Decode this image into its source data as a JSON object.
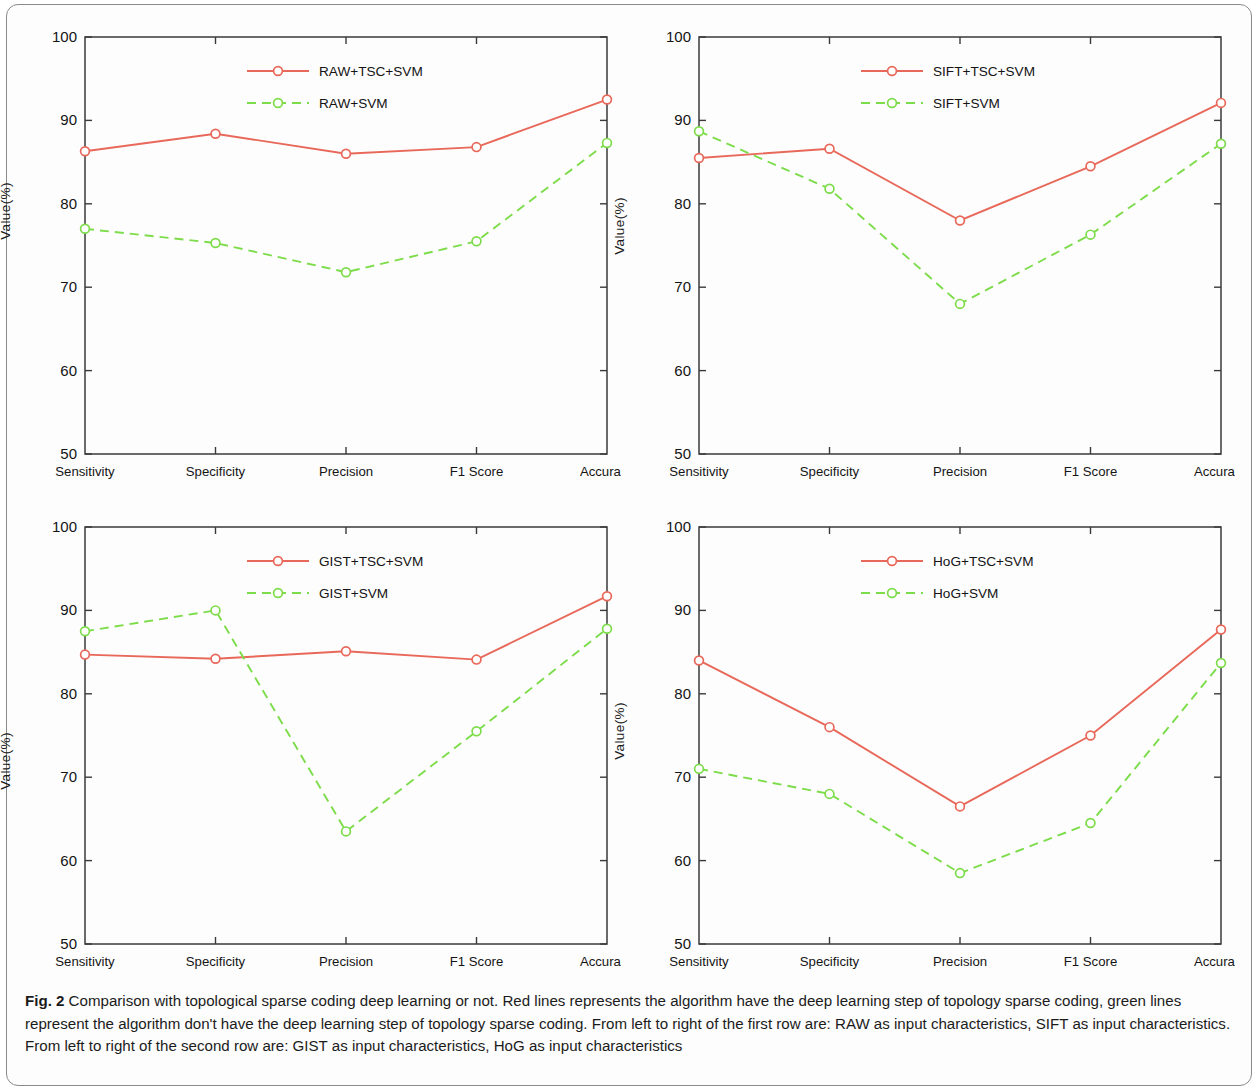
{
  "figure": {
    "label": "Fig. 2",
    "caption": "Comparison with topological sparse coding deep learning or not. Red lines represents the algorithm have the deep learning step of topology sparse coding, green lines represent the algorithm don't have the deep learning step of topology sparse coding. From left to right of the first row are: RAW as input characteristics, SIFT as input characteristics. From left to right of the second row are: GIST as input characteristics, HoG as input characteristics"
  },
  "colors": {
    "red": "#e8685a",
    "green": "#7ddc4a",
    "axis": "#3a3a3a",
    "text": "#141414"
  },
  "axes": {
    "ylabel": "Value(%)",
    "yticks": [
      "100",
      "90",
      "80",
      "70",
      "60",
      "50"
    ],
    "ymin": 50,
    "ymax": 100,
    "categories": [
      "Sensitivity",
      "Specificity",
      "Precision",
      "F1 Score",
      "Accuracy"
    ]
  },
  "chart_data": [
    {
      "type": "line",
      "title": "",
      "panel": "top-left",
      "xlabel": "",
      "ylabel": "Value(%)",
      "ylim": [
        50,
        100
      ],
      "grid": false,
      "legend_position": "top-center",
      "categories": [
        "Sensitivity",
        "Specificity",
        "Precision",
        "F1 Score",
        "Accuracy"
      ],
      "series": [
        {
          "name": "RAW+TSC+SVM",
          "color": "#e8685a",
          "style": "solid",
          "marker": "circle",
          "values": [
            86.3,
            88.4,
            86.0,
            86.8,
            92.5
          ]
        },
        {
          "name": "RAW+SVM",
          "color": "#7ddc4a",
          "style": "dashed",
          "marker": "circle",
          "values": [
            77.0,
            75.3,
            71.8,
            75.5,
            87.3
          ]
        }
      ]
    },
    {
      "type": "line",
      "title": "",
      "panel": "top-right",
      "xlabel": "",
      "ylabel": "Value(%)",
      "ylim": [
        50,
        100
      ],
      "grid": false,
      "legend_position": "top-center",
      "categories": [
        "Sensitivity",
        "Specificity",
        "Precision",
        "F1 Score",
        "Accuracy"
      ],
      "series": [
        {
          "name": "SIFT+TSC+SVM",
          "color": "#e8685a",
          "style": "solid",
          "marker": "circle",
          "values": [
            85.5,
            86.6,
            78.0,
            84.5,
            92.1
          ]
        },
        {
          "name": "SIFT+SVM",
          "color": "#7ddc4a",
          "style": "dashed",
          "marker": "circle",
          "values": [
            88.7,
            81.8,
            68.0,
            76.3,
            87.2
          ]
        }
      ]
    },
    {
      "type": "line",
      "title": "",
      "panel": "bottom-left",
      "xlabel": "",
      "ylabel": "Value(%)",
      "ylim": [
        50,
        100
      ],
      "grid": false,
      "legend_position": "top-center",
      "categories": [
        "Sensitivity",
        "Specificity",
        "Precision",
        "F1 Score",
        "Accuracy"
      ],
      "series": [
        {
          "name": "GIST+TSC+SVM",
          "color": "#e8685a",
          "style": "solid",
          "marker": "circle",
          "values": [
            84.7,
            84.2,
            85.1,
            84.1,
            91.7
          ]
        },
        {
          "name": "GIST+SVM",
          "color": "#7ddc4a",
          "style": "dashed",
          "marker": "circle",
          "values": [
            87.5,
            90.0,
            63.5,
            75.5,
            87.8
          ]
        }
      ]
    },
    {
      "type": "line",
      "title": "",
      "panel": "bottom-right",
      "xlabel": "",
      "ylabel": "Value(%)",
      "ylim": [
        50,
        100
      ],
      "grid": false,
      "legend_position": "top-center",
      "categories": [
        "Sensitivity",
        "Specificity",
        "Precision",
        "F1 Score",
        "Accuracy"
      ],
      "series": [
        {
          "name": "HoG+TSC+SVM",
          "color": "#e8685a",
          "style": "solid",
          "marker": "circle",
          "values": [
            84.0,
            76.0,
            66.5,
            75.0,
            87.7
          ]
        },
        {
          "name": "HoG+SVM",
          "color": "#7ddc4a",
          "style": "dashed",
          "marker": "circle",
          "values": [
            71.0,
            68.0,
            58.5,
            64.5,
            83.7
          ]
        }
      ]
    }
  ]
}
